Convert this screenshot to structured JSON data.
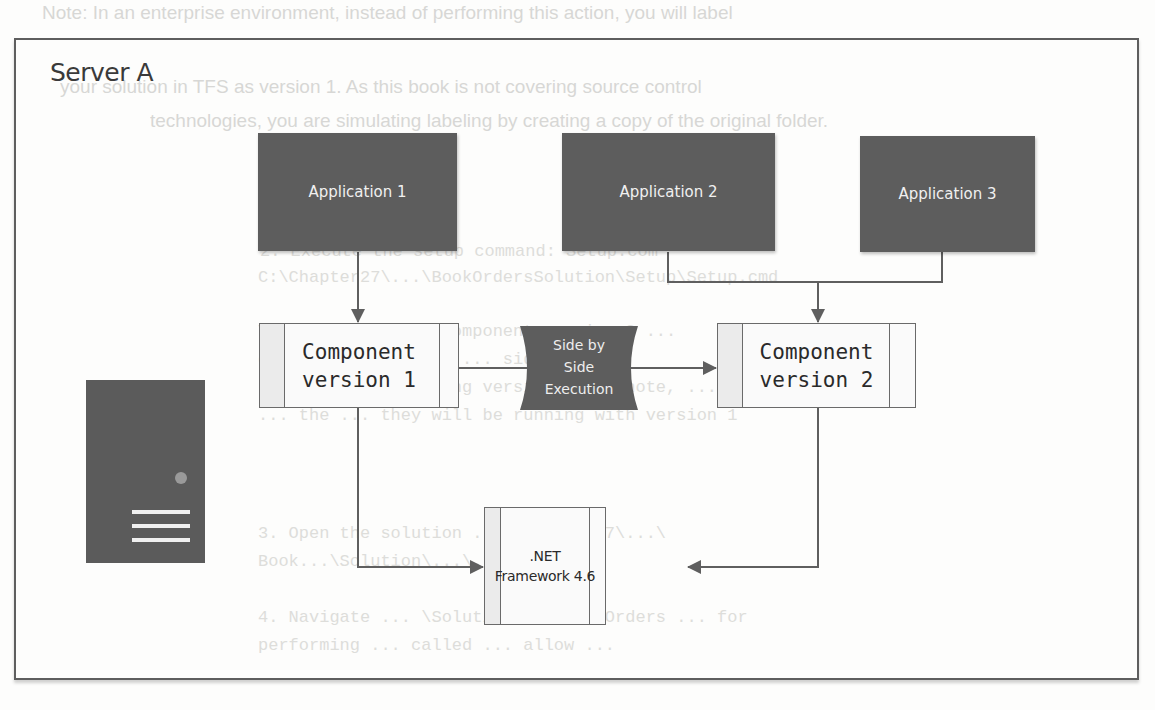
{
  "background_text": {
    "lines": [
      {
        "text": "Note: In an enterprise environment, instead of performing this action, you will label",
        "mono": false
      },
      {
        "text": "your solution in TFS as version 1. As this book is not covering source control",
        "mono": false
      },
      {
        "text": "technologies, you are simulating labeling by creating a copy of the original folder.",
        "mono": false
      },
      {
        "text": "2. Execute the setup command: Setup.com",
        "mono": true
      },
      {
        "text": "C:\\Chapter27\\...\\BookOrdersSolution\\Setup\\Setup.cmd",
        "mono": true
      },
      {
        "text": "This will install component version 2 ...",
        "mono": true
      },
      {
        "text": "component version 2 ... side by side",
        "mono": true
      },
      {
        "text": "running ... deploying version 2 ... note, ...",
        "mono": true
      },
      {
        "text": "... the ... they will be running with version 1",
        "mono": true
      },
      {
        "text": "3. Open the solution ... \\Chapter27\\...\\",
        "mono": true
      },
      {
        "text": "Book...\\Solution\\...\\...sln",
        "mono": true
      },
      {
        "text": "4. Navigate ... \\Solution ... BookOrders ... for",
        "mono": true
      },
      {
        "text": "performing ... called ... allow ...",
        "mono": true
      }
    ]
  },
  "diagram": {
    "title": "Server A",
    "applications": [
      {
        "id": "app1",
        "label": "Application 1"
      },
      {
        "id": "app2",
        "label": "Application 2"
      },
      {
        "id": "app3",
        "label": "Application 3"
      }
    ],
    "components": [
      {
        "id": "comp1",
        "label": "Component\nversion 1"
      },
      {
        "id": "comp2",
        "label": "Component\nversion 2"
      }
    ],
    "side_by_side": {
      "label": "Side by\nSide\nExecution"
    },
    "framework": {
      "label": ".NET\nFramework 4.6"
    },
    "server_icon": "server-tower-icon",
    "edges": [
      {
        "from": "app1",
        "to": "comp1"
      },
      {
        "from": "app2",
        "to": "comp2"
      },
      {
        "from": "app3",
        "to": "comp2"
      },
      {
        "from": "side_by_side",
        "to": "comp1"
      },
      {
        "from": "side_by_side",
        "to": "comp2"
      },
      {
        "from": "comp1",
        "to": "framework"
      },
      {
        "from": "comp2",
        "to": "framework"
      }
    ],
    "colors": {
      "app_fill": "#5d5d5d",
      "app_text": "#f0f0f0",
      "line": "#5f5f5f",
      "frame": "#5e5e5e",
      "component_fill": "#fafafa"
    }
  }
}
